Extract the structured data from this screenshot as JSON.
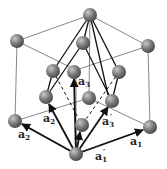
{
  "diagram": {
    "colors": {
      "atom": "#7a7a7a",
      "atom_highlight": "#c8c8c8",
      "cube_edge": "#555555",
      "vector": "#111111",
      "background": "#ffffff"
    },
    "labels": {
      "a1": {
        "base": "a",
        "sub": "1",
        "prime": ""
      },
      "a2": {
        "base": "a",
        "sub": "2",
        "prime": ""
      },
      "a3": {
        "base": "a",
        "sub": "3",
        "prime": ""
      },
      "a1p": {
        "base": "a",
        "sub": "1",
        "prime": "′"
      },
      "a2p": {
        "base": "a",
        "sub": "2",
        "prime": "′"
      },
      "a3p": {
        "base": "a",
        "sub": "3",
        "prime": "′"
      }
    },
    "atoms": [
      {
        "id": "top",
        "x": 90,
        "y": 15
      },
      {
        "id": "back-left-top",
        "x": 17,
        "y": 41
      },
      {
        "id": "right-top",
        "x": 148,
        "y": 46
      },
      {
        "id": "top-face-center",
        "x": 83,
        "y": 43
      },
      {
        "id": "upper-left",
        "x": 53,
        "y": 71
      },
      {
        "id": "upper-mid",
        "x": 74,
        "y": 72
      },
      {
        "id": "upper-right",
        "x": 119,
        "y": 72
      },
      {
        "id": "mid-left",
        "x": 46,
        "y": 97
      },
      {
        "id": "mid-center",
        "x": 89,
        "y": 98
      },
      {
        "id": "mid-right",
        "x": 112,
        "y": 101
      },
      {
        "id": "left",
        "x": 15,
        "y": 121
      },
      {
        "id": "right",
        "x": 150,
        "y": 127
      },
      {
        "id": "lower-center",
        "x": 82,
        "y": 125
      },
      {
        "id": "bottom-origin",
        "x": 76,
        "y": 154
      }
    ]
  }
}
